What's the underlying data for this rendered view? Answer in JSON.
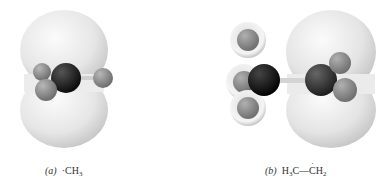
{
  "figure": {
    "panels": [
      {
        "id": "a",
        "label": "(a)",
        "formula_prefix": "·CH",
        "formula_sub": "3",
        "description": "Methyl radical with p-orbital lobes above and below planar CH3"
      },
      {
        "id": "b",
        "label": "(b)",
        "formula_left": "H",
        "formula_left_sub": "3",
        "formula_mid": "C—",
        "formula_dot": "·",
        "formula_c": "C",
        "formula_right": "H",
        "formula_right_sub": "2",
        "description": "Ethyl radical with p-orbital lobes on CH2 carbon"
      }
    ],
    "colors": {
      "orbital_light": "#f2f2f2",
      "orbital_shade": "#c9c9c9",
      "carbon_dark": "#1a1a1a",
      "hydrogen": "#8a8a8a",
      "background": "#ffffff"
    }
  }
}
